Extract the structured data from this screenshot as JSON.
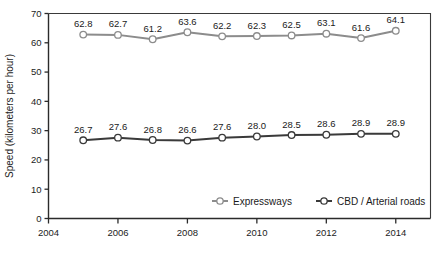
{
  "chart_data": {
    "type": "line",
    "title": "",
    "subtitle": "",
    "xlabel": "",
    "ylabel": "Speed (kilometers per hour)",
    "x": [
      2005,
      2006,
      2007,
      2008,
      2009,
      2010,
      2011,
      2012,
      2013,
      2014
    ],
    "xlim": [
      2004,
      2015
    ],
    "ylim": [
      0,
      70
    ],
    "xticks": [
      2004,
      2006,
      2008,
      2010,
      2012,
      2014
    ],
    "xtick_labels": [
      "2004",
      "2006",
      "2008",
      "2010",
      "2012",
      "2014"
    ],
    "yticks": [
      0,
      10,
      20,
      30,
      40,
      50,
      60,
      70
    ],
    "ytick_labels": [
      "0",
      "10",
      "20",
      "30",
      "40",
      "50",
      "60",
      "70"
    ],
    "grid": false,
    "legend_position": "inside-bottom-right",
    "series": [
      {
        "name": "Expressways",
        "color": "#8c8c8c",
        "marker": "circle-open",
        "values": [
          62.8,
          62.7,
          61.2,
          63.6,
          62.2,
          62.3,
          62.5,
          63.1,
          61.6,
          64.1
        ],
        "labels": [
          "62.8",
          "62.7",
          "61.2",
          "63.6",
          "62.2",
          "62.3",
          "62.5",
          "63.1",
          "61.6",
          "64.1"
        ]
      },
      {
        "name": "CBD / Arterial roads",
        "color": "#3a3a3a",
        "marker": "circle-open",
        "values": [
          26.7,
          27.6,
          26.8,
          26.6,
          27.6,
          28.0,
          28.5,
          28.6,
          28.9,
          28.9
        ],
        "labels": [
          "26.7",
          "27.6",
          "26.8",
          "26.6",
          "27.6",
          "28.0",
          "28.5",
          "28.6",
          "28.9",
          "28.9"
        ]
      }
    ]
  },
  "legend": {
    "items": [
      {
        "label": "Expressways",
        "color": "#8c8c8c"
      },
      {
        "label": "CBD / Arterial roads",
        "color": "#3a3a3a"
      }
    ]
  },
  "axes": {
    "y_title": "Speed (kilometers per hour)"
  }
}
